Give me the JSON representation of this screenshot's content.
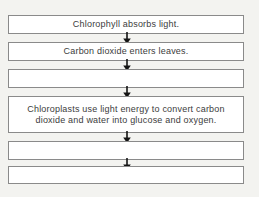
{
  "diagram": {
    "name": "photosynthesis-flowchart",
    "colors": {
      "background": "#f3f3f0",
      "box_fill": "#ffffff",
      "box_border": "#8a8a8a",
      "text": "#3c3c3c",
      "arrow": "#141414"
    },
    "steps": [
      {
        "lines": [
          "Chlorophyll absorbs light."
        ]
      },
      {
        "lines": [
          "Carbon dioxide enters leaves."
        ]
      },
      {
        "lines": []
      },
      {
        "lines": [
          "Chloroplasts use light energy to convert carbon",
          "dioxide and water into glucose and oxygen."
        ]
      },
      {
        "lines": []
      },
      {
        "lines": []
      }
    ],
    "arrow_icon": "down-arrow"
  }
}
